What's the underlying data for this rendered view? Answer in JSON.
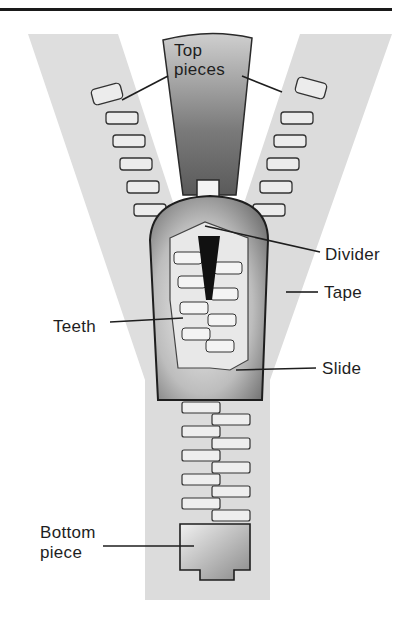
{
  "diagram": {
    "labels": {
      "top_pieces": "Top\npieces",
      "top_line1": "Top",
      "top_line2": "pieces",
      "divider": "Divider",
      "tape": "Tape",
      "teeth": "Teeth",
      "slide": "Slide",
      "bottom_line1": "Bottom",
      "bottom_line2": "piece"
    },
    "colors": {
      "tape": "#dcdcdc",
      "metal_dark": "#6e6e6e",
      "metal_light": "#efefef",
      "outline": "#2a2a2a",
      "text": "#1e1e1e",
      "background": "#ffffff"
    }
  }
}
